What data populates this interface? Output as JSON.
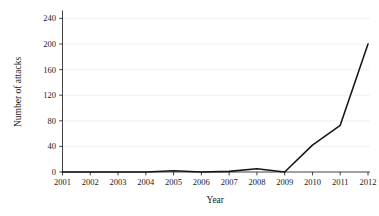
{
  "chart_data": {
    "type": "line",
    "title": "",
    "xlabel": "Year",
    "ylabel": "Number of attacks",
    "categories": [
      "2001",
      "2002",
      "2003",
      "2004",
      "2005",
      "2006",
      "2007",
      "2008",
      "2009",
      "2010",
      "2011",
      "2012"
    ],
    "x": [
      2001,
      2002,
      2003,
      2004,
      2005,
      2006,
      2007,
      2008,
      2009,
      2010,
      2011,
      2012
    ],
    "values": [
      0,
      0,
      0,
      0,
      2,
      0,
      1,
      5,
      0,
      42,
      73,
      200
    ],
    "series": [
      {
        "name": "Number of attacks",
        "values": [
          0,
          0,
          0,
          0,
          2,
          0,
          1,
          5,
          0,
          42,
          73,
          200
        ]
      }
    ],
    "ylim": [
      0,
      250
    ],
    "xlim": [
      2000.6,
      2012.4
    ],
    "yticks": [
      0,
      40,
      80,
      120,
      160,
      200,
      240
    ],
    "ytick_labels": [
      "0",
      "40",
      "80",
      "120",
      "160",
      "200",
      "240"
    ],
    "xticks": [
      2001,
      2002,
      2003,
      2004,
      2005,
      2006,
      2007,
      2008,
      2009,
      2010,
      2011,
      2012
    ],
    "xtick_labels": [
      "2001",
      "2002",
      "2003",
      "2004",
      "2005",
      "2006",
      "2007",
      "2008",
      "2009",
      "2010",
      "2011",
      "2012"
    ],
    "grid": "horizontal",
    "legend": "none",
    "line_color": "#161616",
    "grid_color": "#eceef1",
    "axis_color": "#2b2b2b",
    "background": "#ffffff"
  }
}
